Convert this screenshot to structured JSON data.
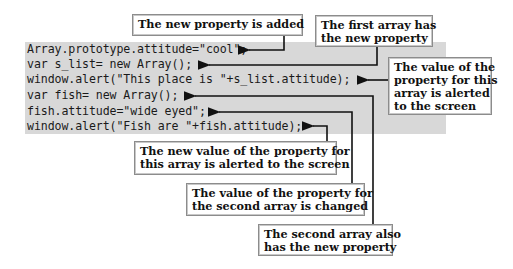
{
  "code": {
    "lines": [
      "Array.prototype.attitude=\"cool\";",
      "var s_list= new Array();",
      "window.alert(\"This place is \"+s_list.attitude);",
      "var fish= new Array();",
      "fish.attitude=\"wide eyed\";",
      "window.alert(\"Fish are \"+fish.attitude);"
    ],
    "background": "#d8d8d8"
  },
  "callouts": [
    {
      "id": "new-property-added",
      "text": "The new property is added",
      "points_to_line": 1
    },
    {
      "id": "first-array-has-property",
      "text": "The first array has\nthe new property",
      "points_to_line": 2
    },
    {
      "id": "first-value-alerted",
      "text": "The value of the\nproperty for this\narray is alerted\nto the screen",
      "points_to_line": 3
    },
    {
      "id": "new-value-alerted",
      "text": "The new value of the property for\nthis array is alerted to the screen",
      "points_to_line": 6
    },
    {
      "id": "second-value-changed",
      "text": "The value of the property for\nthe second array is changed",
      "points_to_line": 5
    },
    {
      "id": "second-array-has-property",
      "text": "The second array also\nhas the new property",
      "points_to_line": 4
    }
  ],
  "colors": {
    "connector": "#111111",
    "callout_border": "#8c8c8c"
  }
}
